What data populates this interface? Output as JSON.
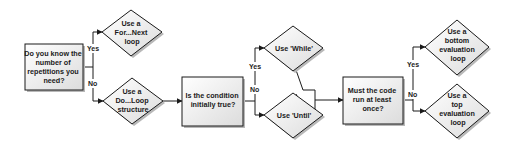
{
  "diagram": {
    "colors": {
      "stroke": "#1a1a1a",
      "fill_top": "#ffffff",
      "fill_bottom": "#dcdcdc",
      "shadow": "#b8b8b8",
      "text": "#1a1a1a"
    },
    "nodes": {
      "q_know_reps": {
        "shape": "rect",
        "lines": [
          "Do you know the",
          "number of",
          "repetitions you",
          "need?"
        ]
      },
      "use_for_next": {
        "shape": "diamond",
        "lines": [
          "Use a",
          "For...Next",
          "loop"
        ]
      },
      "use_do_loop": {
        "shape": "diamond",
        "lines": [
          "Use a",
          "Do...Loop",
          "structure"
        ]
      },
      "q_condition_true": {
        "shape": "rect",
        "lines": [
          "Is the condition",
          "initially true?"
        ]
      },
      "use_while": {
        "shape": "diamond",
        "lines": [
          "Use 'While'"
        ]
      },
      "use_until": {
        "shape": "diamond",
        "lines": [
          "Use 'Until'"
        ]
      },
      "q_run_once": {
        "shape": "rect",
        "lines": [
          "Must the code",
          "run at least",
          "once?"
        ]
      },
      "use_bottom_eval": {
        "shape": "diamond",
        "lines": [
          "Use a",
          "bottom",
          "evaluation",
          "loop"
        ]
      },
      "use_top_eval": {
        "shape": "diamond",
        "lines": [
          "Use a",
          "top",
          "evaluation",
          "loop"
        ]
      }
    },
    "branches": {
      "b1": {
        "yes": "Yes",
        "no": "No"
      },
      "b2": {
        "yes": "Yes",
        "no": "No"
      },
      "b3": {
        "yes": "Yes",
        "no": "No"
      }
    },
    "edges": [
      {
        "from": "q_know_reps",
        "to": "use_for_next",
        "label": "Yes"
      },
      {
        "from": "q_know_reps",
        "to": "use_do_loop",
        "label": "No"
      },
      {
        "from": "use_do_loop",
        "to": "q_condition_true",
        "label": ""
      },
      {
        "from": "q_condition_true",
        "to": "use_while",
        "label": "Yes"
      },
      {
        "from": "q_condition_true",
        "to": "use_until",
        "label": "No"
      },
      {
        "from": "use_while",
        "to": "q_run_once",
        "label": ""
      },
      {
        "from": "use_until",
        "to": "q_run_once",
        "label": ""
      },
      {
        "from": "q_run_once",
        "to": "use_bottom_eval",
        "label": "Yes"
      },
      {
        "from": "q_run_once",
        "to": "use_top_eval",
        "label": "No"
      }
    ]
  }
}
